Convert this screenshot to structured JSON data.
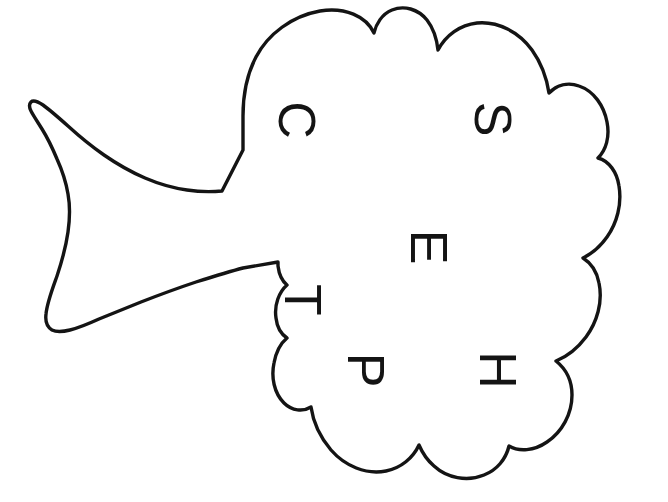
{
  "image": {
    "kind": "captcha",
    "width": 668,
    "height": 502,
    "background_color": "#ffffff",
    "ink_color": "#141414",
    "description": "Hand-drawn cloud / thought-bubble outline with a flared trumpet-shaped tail on the left, containing six rotated capital letters",
    "alt_text": "Distorted captcha: cloud outline with rotated letters"
  },
  "shape": {
    "name": "cloud-speech-bubble",
    "stroke_color": "#141414",
    "stroke_width": 3.2,
    "fill": "#ffffff",
    "outline_path": "M 241 147 L 228 150 C 210 155 190 160 168 166 C 146 172 122 179 102 186 C 90 190 78 194 68 197 C 58 200 48 203 41 204 C 36 205 33 204 32 201 C 31 197 34 192 39 186 C 46 177 53 168 58 159 C 62 152 65 146 67 141 C 69 136 70 132 70 129 C 70 127 69 126 67 126 C 64 126 58 128 52 130 C 46 132 42 133 39 133 C 35 133 33 131 32 128 C 31 125 32 122 35 120 C 38 118 43 120 50 124 C 57 128 66 134 74 139 C 83 145 93 151 103 157 C 113 163 124 169 135 175 C 146 181 157 186 167 190 C 177 194 186 197 194 199 L 205 201 L 214 202",
    "outline_description": "Irregular hand-drawn bumpy cloud contour: scalloped top with three lobes, a two-lobed right edge with deep notches, a bumpy bottom, and a narrow flaring tail extending to the far left"
  },
  "letters": [
    {
      "char": "C",
      "x": 297,
      "y": 120,
      "rotation": 90,
      "font_size": 52
    },
    {
      "char": "S",
      "x": 493,
      "y": 119,
      "rotation": 90,
      "font_size": 52
    },
    {
      "char": "E",
      "x": 429,
      "y": 247,
      "rotation": 90,
      "font_size": 52
    },
    {
      "char": "T",
      "x": 303,
      "y": 300,
      "rotation": 90,
      "font_size": 52
    },
    {
      "char": "P",
      "x": 366,
      "y": 370,
      "rotation": 90,
      "font_size": 52
    },
    {
      "char": "H",
      "x": 498,
      "y": 370,
      "rotation": 90,
      "font_size": 52
    }
  ],
  "captcha_text": "CSETPH"
}
